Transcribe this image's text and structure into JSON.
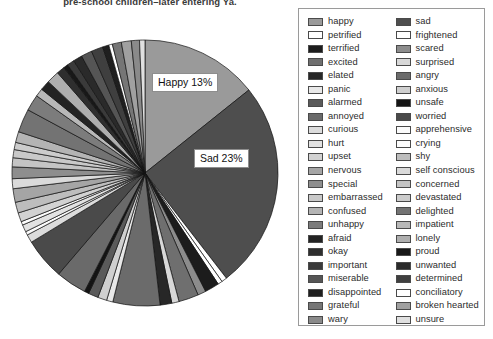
{
  "title": "pre-school children–later entering Ya.",
  "callouts": {
    "happy": "Happy 13%",
    "sad": "Sad 23%"
  },
  "legend": {
    "column_one": [
      {
        "label": "happy",
        "color": "#9a9a9a"
      },
      {
        "label": "petrified",
        "color": "#ffffff"
      },
      {
        "label": "terrified",
        "color": "#1c1c1c"
      },
      {
        "label": "excited",
        "color": "#6f6f6f"
      },
      {
        "label": "elated",
        "color": "#272727"
      },
      {
        "label": "panic",
        "color": "#e8e8e8"
      },
      {
        "label": "alarmed",
        "color": "#5a5a5a"
      },
      {
        "label": "annoyed",
        "color": "#6a6a6a"
      },
      {
        "label": "curious",
        "color": "#dcdcdc"
      },
      {
        "label": "hurt",
        "color": "#e2e2e2"
      },
      {
        "label": "upset",
        "color": "#d2d2d2"
      },
      {
        "label": "nervous",
        "color": "#a5a5a5"
      },
      {
        "label": "special",
        "color": "#8e8e8e"
      },
      {
        "label": "embarrassed",
        "color": "#c9c9c9"
      },
      {
        "label": "confused",
        "color": "#b4b4b4"
      },
      {
        "label": "unhappy",
        "color": "#7c7c7c"
      },
      {
        "label": "afraid",
        "color": "#232323"
      },
      {
        "label": "okay",
        "color": "#2e2e2e"
      },
      {
        "label": "important",
        "color": "#3a3a3a"
      },
      {
        "label": "miserable",
        "color": "#555555"
      },
      {
        "label": "disappointed",
        "color": "#1f1f1f"
      },
      {
        "label": "grateful",
        "color": "#767676"
      },
      {
        "label": "wary",
        "color": "#8a8a8a"
      }
    ],
    "column_two": [
      {
        "label": "sad",
        "color": "#4e4e4e"
      },
      {
        "label": "frightened",
        "color": "#ffffff"
      },
      {
        "label": "scared",
        "color": "#8c8c8c"
      },
      {
        "label": "surprised",
        "color": "#d8d8d8"
      },
      {
        "label": "angry",
        "color": "#6b6b6b"
      },
      {
        "label": "anxious",
        "color": "#cfcfcf"
      },
      {
        "label": "unsafe",
        "color": "#141414"
      },
      {
        "label": "worried",
        "color": "#4a4a4a"
      },
      {
        "label": "apprehensive",
        "color": "#fbfbfb"
      },
      {
        "label": "crying",
        "color": "#fdfdfd"
      },
      {
        "label": "shy",
        "color": "#bdbdbd"
      },
      {
        "label": "self conscious",
        "color": "#dadada"
      },
      {
        "label": "concerned",
        "color": "#c4c4c4"
      },
      {
        "label": "devastated",
        "color": "#cccccc"
      },
      {
        "label": "delighted",
        "color": "#737373"
      },
      {
        "label": "impatient",
        "color": "#b8b8b8"
      },
      {
        "label": "lonely",
        "color": "#aeaeae"
      },
      {
        "label": "proud",
        "color": "#181818"
      },
      {
        "label": "unwanted",
        "color": "#2a2a2a"
      },
      {
        "label": "determined",
        "color": "#3f3f3f"
      },
      {
        "label": "conciliatory",
        "color": "#ffffff"
      },
      {
        "label": "broken hearted",
        "color": "#a0a0a0"
      },
      {
        "label": "unsure",
        "color": "#e0e0e0"
      }
    ]
  },
  "chart_data": {
    "type": "pie",
    "title": "pre-school children–later entering Ya.",
    "legend_position": "right",
    "labeled_slices": [
      {
        "name": "happy",
        "percent": 13,
        "data_label": "Happy 13%"
      },
      {
        "name": "sad",
        "percent": 23,
        "data_label": "Sad 23%"
      }
    ],
    "categories": [
      "happy",
      "sad",
      "petrified",
      "frightened",
      "terrified",
      "scared",
      "excited",
      "surprised",
      "elated",
      "angry",
      "panic",
      "anxious",
      "alarmed",
      "unsafe",
      "annoyed",
      "worried",
      "curious",
      "apprehensive",
      "hurt",
      "crying",
      "upset",
      "shy",
      "nervous",
      "self conscious",
      "special",
      "concerned",
      "embarrassed",
      "devastated",
      "confused",
      "delighted",
      "unhappy",
      "impatient",
      "afraid",
      "lonely",
      "okay",
      "proud",
      "important",
      "unwanted",
      "miserable",
      "determined",
      "disappointed",
      "conciliatory",
      "grateful",
      "broken hearted",
      "wary",
      "unsure"
    ],
    "values": [
      13,
      23,
      0.6,
      0.5,
      1.6,
      0.9,
      2.2,
      0.8,
      1.3,
      5.2,
      0.7,
      1.0,
      1.1,
      0.5,
      3.4,
      4.6,
      0.9,
      0.4,
      0.8,
      0.4,
      1.0,
      1.2,
      1.5,
      1.1,
      1.3,
      1.0,
      0.9,
      0.8,
      1.2,
      2.6,
      1.8,
      0.9,
      1.1,
      1.4,
      0.9,
      0.5,
      0.8,
      1.0,
      1.2,
      1.3,
      0.7,
      0.4,
      1.0,
      1.1,
      0.9,
      0.6
    ],
    "colors": [
      "#9a9a9a",
      "#4e4e4e",
      "#ffffff",
      "#ffffff",
      "#1c1c1c",
      "#8c8c8c",
      "#6f6f6f",
      "#d8d8d8",
      "#272727",
      "#6b6b6b",
      "#e8e8e8",
      "#cfcfcf",
      "#5a5a5a",
      "#141414",
      "#6a6a6a",
      "#4a4a4a",
      "#dcdcdc",
      "#fbfbfb",
      "#e2e2e2",
      "#fdfdfd",
      "#d2d2d2",
      "#bdbdbd",
      "#a5a5a5",
      "#dadada",
      "#8e8e8e",
      "#c4c4c4",
      "#c9c9c9",
      "#cccccc",
      "#b4b4b4",
      "#737373",
      "#7c7c7c",
      "#b8b8b8",
      "#232323",
      "#aeaeae",
      "#2e2e2e",
      "#181818",
      "#3a3a3a",
      "#2a2a2a",
      "#555555",
      "#3f3f3f",
      "#1f1f1f",
      "#ffffff",
      "#767676",
      "#a0a0a0",
      "#8a8a8a",
      "#e0e0e0"
    ],
    "units": "percent",
    "xlabel": "",
    "ylabel": ""
  }
}
